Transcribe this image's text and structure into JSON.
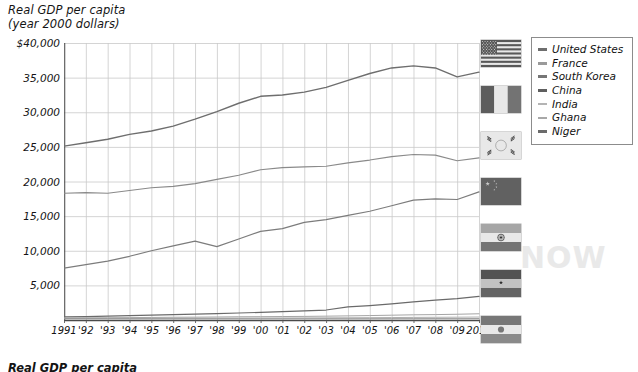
{
  "chart_data": {
    "type": "line",
    "title": "Real GDP per capita\n(year 2000 dollars)",
    "footer_title": "Real GDP per capita",
    "xlabel": "",
    "ylabel": "Real GDP per capita (year 2000 dollars)",
    "grid": true,
    "legend_position": "right",
    "ylim": [
      0,
      40000
    ],
    "ytick_labels": [
      "$40,000",
      "35,000",
      "30,000",
      "25,000",
      "20,000",
      "15,000",
      "10,000",
      "5,000"
    ],
    "ytick_values": [
      40000,
      35000,
      30000,
      25000,
      20000,
      15000,
      10000,
      5000
    ],
    "x": [
      1991,
      1992,
      1993,
      1994,
      1995,
      1996,
      1997,
      1998,
      1999,
      2000,
      2001,
      2002,
      2003,
      2004,
      2005,
      2006,
      2007,
      2008,
      2009,
      2010
    ],
    "categories": [
      "1991",
      "'92",
      "'93",
      "'94",
      "'95",
      "'96",
      "'97",
      "'98",
      "'99",
      "'00",
      "'01",
      "'02",
      "'03",
      "'04",
      "'05",
      "'06",
      "'07",
      "'08",
      "'09",
      "2010"
    ],
    "series": [
      {
        "name": "United States",
        "color": "#6e6e6e",
        "width": 1.4,
        "values": [
          25100,
          25600,
          26100,
          26800,
          27300,
          28000,
          29000,
          30100,
          31300,
          32300,
          32500,
          32900,
          33600,
          34600,
          35600,
          36400,
          36700,
          36400,
          35100,
          35800
        ]
      },
      {
        "name": "France",
        "color": "#8a8a8a",
        "width": 1.2,
        "values": [
          18300,
          18400,
          18300,
          18700,
          19100,
          19300,
          19700,
          20300,
          20900,
          21700,
          22000,
          22100,
          22200,
          22700,
          23100,
          23600,
          23900,
          23800,
          23000,
          23400
        ]
      },
      {
        "name": "South Korea",
        "color": "#7c7c7c",
        "width": 1.2,
        "values": [
          7500,
          8000,
          8500,
          9200,
          10000,
          10700,
          11400,
          10600,
          11700,
          12800,
          13200,
          14100,
          14500,
          15100,
          15700,
          16500,
          17300,
          17500,
          17400,
          18500
        ]
      },
      {
        "name": "China",
        "color": "#6a6a6a",
        "width": 1.2,
        "values": [
          450,
          500,
          560,
          630,
          700,
          780,
          860,
          930,
          1010,
          1100,
          1200,
          1310,
          1440,
          1890,
          2080,
          2320,
          2620,
          2860,
          3080,
          3400
        ]
      },
      {
        "name": "India",
        "color": "#a5a5a5",
        "width": 1.0,
        "values": [
          300,
          310,
          325,
          345,
          370,
          395,
          410,
          435,
          465,
          480,
          500,
          520,
          555,
          595,
          640,
          695,
          750,
          780,
          830,
          900
        ]
      },
      {
        "name": "Ghana",
        "color": "#b0b0b0",
        "width": 1.0,
        "values": [
          230,
          235,
          240,
          245,
          252,
          260,
          266,
          274,
          282,
          288,
          294,
          302,
          312,
          324,
          336,
          352,
          372,
          392,
          404,
          428
        ]
      },
      {
        "name": "Niger",
        "color": "#8f8f8f",
        "width": 1.0,
        "values": [
          175,
          172,
          168,
          166,
          167,
          168,
          169,
          173,
          172,
          167,
          171,
          173,
          177,
          173,
          177,
          180,
          182,
          188,
          184,
          192
        ]
      }
    ]
  },
  "legend": {
    "items": [
      {
        "label": "United States",
        "color": "#6e6e6e",
        "weight": 3
      },
      {
        "label": "France",
        "color": "#9a9a9a",
        "weight": 2.4
      },
      {
        "label": "South Korea",
        "color": "#767676",
        "weight": 3
      },
      {
        "label": "China",
        "color": "#5f5f5f",
        "weight": 3.2
      },
      {
        "label": "India",
        "color": "#b4b4b4",
        "weight": 2.2
      },
      {
        "label": "Ghana",
        "color": "#a8a8a8",
        "weight": 2.4
      },
      {
        "label": "Niger",
        "color": "#6b6b6b",
        "weight": 3.2
      }
    ]
  },
  "flags": [
    {
      "name": "united-states-flag",
      "country": "United States",
      "top": 4
    },
    {
      "name": "france-flag",
      "country": "France",
      "top": 50
    },
    {
      "name": "south-korea-flag",
      "country": "South Korea",
      "top": 96
    },
    {
      "name": "china-flag",
      "country": "China",
      "top": 142
    },
    {
      "name": "india-flag",
      "country": "India",
      "top": 188
    },
    {
      "name": "ghana-flag",
      "country": "Ghana",
      "top": 234
    },
    {
      "name": "niger-flag",
      "country": "Niger",
      "top": 280
    }
  ],
  "watermark": {
    "text": "NOW"
  }
}
